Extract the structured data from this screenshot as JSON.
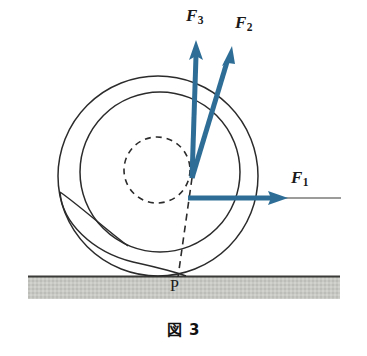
{
  "figure": {
    "caption": "図 3",
    "contact_point_label": "P",
    "colors": {
      "arrow_blue": "#2E6E96",
      "line_black": "#1a1a1a",
      "ground_grey": "#c6c6c2",
      "ground_edge": "#4a4a48",
      "background": "#ffffff"
    }
  },
  "vectors": [
    {
      "id": "f1",
      "name": "F",
      "subscript": "1",
      "label": "F1",
      "origin": [
        192,
        178
      ],
      "tip": [
        285,
        198
      ],
      "direction": "right",
      "angle_deg": 0
    },
    {
      "id": "f2",
      "name": "F",
      "subscript": "2",
      "label": "F2",
      "origin": [
        192,
        178
      ],
      "tip": [
        232,
        48
      ],
      "direction": "up-right",
      "angle_deg": 73
    },
    {
      "id": "f3",
      "name": "F",
      "subscript": "3",
      "label": "F3",
      "origin": [
        192,
        178
      ],
      "tip": [
        196,
        42
      ],
      "direction": "up",
      "angle_deg": 88
    }
  ],
  "shapes": {
    "outer_circle": {
      "cx": 158,
      "cy": 176,
      "r": 100
    },
    "middle_circle": {
      "cx": 160,
      "cy": 172,
      "r": 80
    },
    "inner_dashed_circle": {
      "cx": 157,
      "cy": 170,
      "r": 33
    },
    "ground": {
      "x": 28,
      "y": 276,
      "width": 312,
      "height": 22
    },
    "dashed_radius_line": {
      "from": [
        192,
        178
      ],
      "to": [
        178,
        276
      ]
    },
    "f1_extension_line": {
      "from": [
        285,
        198
      ],
      "to": [
        341,
        198
      ]
    }
  }
}
